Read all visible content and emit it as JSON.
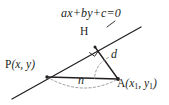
{
  "figure": {
    "kind": "geometry-diagram",
    "title_text": "",
    "background_color": "#ffffff",
    "stroke_color": "#231f20",
    "dash_color": "#8d8d8d",
    "labels": {
      "line_equation": "ax+by+c=0",
      "foot_point": "H",
      "distance": "d",
      "segment_n": "n",
      "point_p_name": "P",
      "point_p_coords": "(x, y)",
      "point_a_name": "A",
      "point_a_coords_open": "(x",
      "point_a_sub1": "1",
      "point_a_comma": ", y",
      "point_a_sub2": "1",
      "point_a_close": ")"
    },
    "geometry": {
      "line_start": [
        12,
        99
      ],
      "line_end": [
        141,
        27
      ],
      "point_P": [
        47,
        77
      ],
      "point_H": [
        95,
        47
      ],
      "point_A": [
        118,
        79
      ],
      "right_angle_at": "H",
      "arc_at_A": true,
      "arc_from_P_to_A": true
    }
  }
}
